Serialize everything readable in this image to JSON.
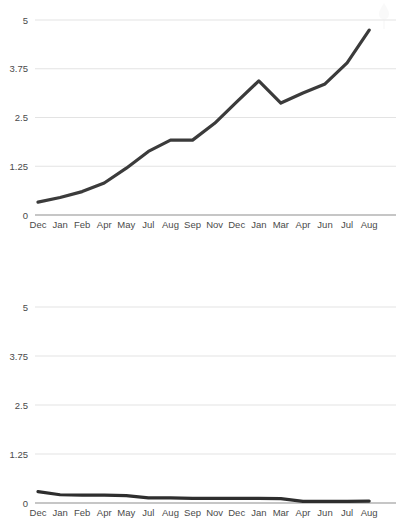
{
  "chart_data": [
    {
      "id": "top-chart",
      "type": "line",
      "title": "",
      "subtitle": "",
      "xlabel": "",
      "ylabel": "",
      "grid": true,
      "legend": "none",
      "ylim": [
        0,
        5
      ],
      "yticks": [
        0,
        1.25,
        2.5,
        3.75,
        5
      ],
      "ytick_labels": [
        "0",
        "1.25",
        "2.5",
        "3.75",
        "5"
      ],
      "categories": [
        "Dec",
        "Jan",
        "Feb",
        "Apr",
        "May",
        "Jul",
        "Aug",
        "Sep",
        "Nov",
        "Dec",
        "Jan",
        "Mar",
        "Apr",
        "Jun",
        "Jul",
        "Aug"
      ],
      "series": [
        {
          "name": "Series 1",
          "color": "#3b3b3b",
          "values": [
            0.33,
            0.45,
            0.6,
            0.82,
            1.2,
            1.63,
            1.92,
            1.92,
            2.35,
            2.9,
            3.44,
            2.87,
            3.13,
            3.36,
            3.9,
            4.74
          ]
        }
      ]
    },
    {
      "id": "bottom-chart",
      "type": "line",
      "title": "",
      "subtitle": "",
      "xlabel": "",
      "ylabel": "",
      "grid": true,
      "legend": "none",
      "ylim": [
        0,
        5
      ],
      "yticks": [
        0,
        1.25,
        2.5,
        3.75,
        5
      ],
      "ytick_labels": [
        "0",
        "1.25",
        "2.5",
        "3.75",
        "5"
      ],
      "categories": [
        "Dec",
        "Jan",
        "Feb",
        "Apr",
        "May",
        "Jul",
        "Aug",
        "Sep",
        "Nov",
        "Dec",
        "Jan",
        "Mar",
        "Apr",
        "Jun",
        "Jul",
        "Aug"
      ],
      "series": [
        {
          "name": "Series 1",
          "color": "#2e2e2e",
          "values": [
            0.29,
            0.21,
            0.2,
            0.2,
            0.19,
            0.13,
            0.13,
            0.12,
            0.12,
            0.12,
            0.12,
            0.11,
            0.04,
            0.04,
            0.04,
            0.05
          ]
        }
      ]
    }
  ],
  "style": {
    "background": "#ffffff",
    "grid_color": "#e3e3e3",
    "axis_color": "#8d8d8d",
    "tick_label_color": "#4a4a4a",
    "line_color": "#3b3b3b",
    "line_width": 3.2,
    "watermark_color": "#f0f0f0"
  },
  "watermark": {
    "name": "tree-watermark",
    "visible": true
  }
}
